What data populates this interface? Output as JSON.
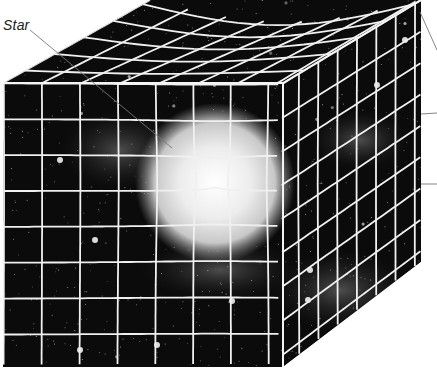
{
  "diagram": {
    "labels": {
      "star": "Star"
    },
    "colors": {
      "background": "#ffffff",
      "space": "#0b0b0b",
      "grid": "#f2f2f2",
      "star_core": "#ffffff",
      "star_glow": "#bdbdbd",
      "leader": "#777777"
    },
    "cube": {
      "front_face": [
        [
          3,
          83
        ],
        [
          283,
          83
        ],
        [
          283,
          367
        ],
        [
          3,
          367
        ]
      ],
      "top_face": [
        [
          3,
          83
        ],
        [
          150,
          0
        ],
        [
          421,
          0
        ],
        [
          283,
          83
        ]
      ],
      "right_face": [
        [
          283,
          83
        ],
        [
          421,
          0
        ],
        [
          421,
          262
        ],
        [
          283,
          367
        ]
      ]
    },
    "star": {
      "cx": 215,
      "cy": 183,
      "r": 72
    },
    "leader_lines": [
      {
        "name": "star-leader",
        "from": [
          30,
          30
        ],
        "to": [
          172,
          148
        ]
      },
      {
        "name": "right-leader-1",
        "from": [
          420,
          10
        ],
        "to": [
          437,
          48
        ]
      },
      {
        "name": "right-leader-2",
        "from": [
          421,
          114
        ],
        "to": [
          437,
          113
        ]
      },
      {
        "name": "right-leader-3",
        "from": [
          421,
          184
        ],
        "to": [
          437,
          184
        ]
      }
    ]
  }
}
